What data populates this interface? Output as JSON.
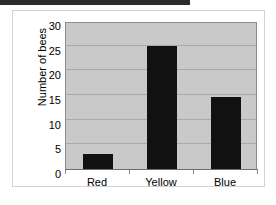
{
  "figure": {
    "top_band_label": "scan-edge-band",
    "frame_label": "figure-border"
  },
  "chart_data": {
    "type": "bar",
    "title": "",
    "xlabel": "",
    "ylabel": "Number of bees",
    "categories": [
      "Red",
      "Yellow",
      "Blue"
    ],
    "values": [
      3,
      25,
      14.5
    ],
    "ylim": [
      0,
      30
    ],
    "yticks": [
      0,
      5,
      10,
      15,
      20,
      25,
      30
    ],
    "ytick_labels": [
      "0",
      "5",
      "10",
      "15",
      "20",
      "25",
      "30"
    ],
    "grid": true,
    "legend": "none",
    "bar_color": "#111111",
    "plot_background": "#c9c9c9",
    "gridline_color": "#a9a9a9"
  }
}
